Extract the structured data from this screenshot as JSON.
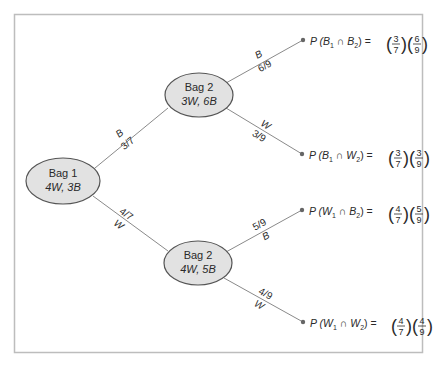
{
  "nodes": {
    "bag1": {
      "title": "Bag 1",
      "contents": "4W, 3B"
    },
    "bag2_top": {
      "title": "Bag 2",
      "contents": "3W, 6B"
    },
    "bag2_bottom": {
      "title": "Bag 2",
      "contents": "4W, 5B"
    }
  },
  "branches": {
    "b1_B": {
      "event": "B",
      "prob": "3/7"
    },
    "b1_W": {
      "event": "W",
      "prob": "4/7"
    },
    "top_B": {
      "event": "B",
      "prob": "6/9"
    },
    "top_W": {
      "event": "W",
      "prob": "3/9"
    },
    "bot_B": {
      "event": "B",
      "prob": "5/9"
    },
    "bot_W": {
      "event": "W",
      "prob": "4/9"
    }
  },
  "outcomes": [
    {
      "prefix": "P (",
      "a": "B",
      "a_sub": "1",
      "op": " ∩ ",
      "b": "B",
      "b_sub": "2",
      "suffix": ") =",
      "f1_num": "3",
      "f1_den": "7",
      "f2_num": "6",
      "f2_den": "9"
    },
    {
      "prefix": "P (",
      "a": "B",
      "a_sub": "1",
      "op": " ∩ ",
      "b": "W",
      "b_sub": "2",
      "suffix": ") =",
      "f1_num": "3",
      "f1_den": "7",
      "f2_num": "3",
      "f2_den": "9"
    },
    {
      "prefix": "P (",
      "a": "W",
      "a_sub": "1",
      "op": " ∩ ",
      "b": "B",
      "b_sub": "2",
      "suffix": ") =",
      "f1_num": "4",
      "f1_den": "7",
      "f2_num": "5",
      "f2_den": "9"
    },
    {
      "prefix": "P (",
      "a": "W",
      "a_sub": "1",
      "op": " ∩ ",
      "b": "W",
      "b_sub": "2",
      "suffix": ") =",
      "f1_num": "4",
      "f1_den": "7",
      "f2_num": "4",
      "f2_den": "9"
    }
  ],
  "colors": {
    "ellipse_fill": "#e2e2e2",
    "frame": "#bdbdbd",
    "line": "#8a8a8a"
  }
}
